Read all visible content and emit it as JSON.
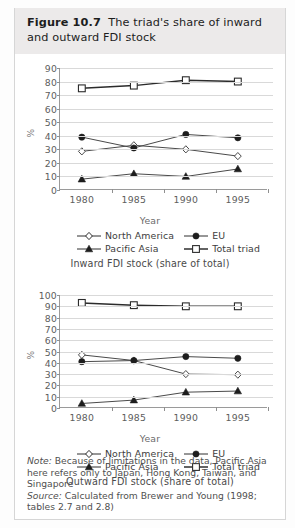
{
  "figure": {
    "label": "Figure 10.7",
    "title": "The triad's share of inward and outward FDI stock"
  },
  "footer": {
    "note_label": "Note:",
    "note_text": " Because of limitations in the data, Pacific Asia here refers only to Japan, Hong Kong, Taiwan, and Singapore",
    "source_label": "Source:",
    "source_text": " Calculated from Brewer and Young (1998; tables 2.7 and 2.8)"
  },
  "legend": {
    "north_america": "North America",
    "eu": "EU",
    "pacific_asia": "Pacific Asia",
    "total_triad": "Total triad"
  },
  "axis": {
    "ylabel": "%",
    "xlabel": "Year"
  },
  "charts": [
    {
      "caption": "Inward FDI stock (share of total)",
      "yticks": [
        "90",
        "80",
        "70",
        "60",
        "50",
        "40",
        "30",
        "20",
        "10",
        "0"
      ],
      "xticks": [
        "1980",
        "1985",
        "1990",
        "1995"
      ]
    },
    {
      "caption": "Outward FDI stock (share of total)",
      "yticks": [
        "100",
        "90",
        "80",
        "70",
        "60",
        "50",
        "40",
        "30",
        "20",
        "10",
        "0"
      ],
      "xticks": [
        "1980",
        "1985",
        "1990",
        "1995"
      ]
    }
  ],
  "chart_data": [
    {
      "type": "line",
      "title": "Inward FDI stock (share of total)",
      "xlabel": "Year",
      "ylabel": "%",
      "categories": [
        1980,
        1985,
        1990,
        1995
      ],
      "ylim": [
        0,
        90
      ],
      "ytick_step": 10,
      "grid": true,
      "legend_position": "bottom",
      "series": [
        {
          "name": "North America",
          "marker": "open-diamond",
          "values": [
            28.5,
            33,
            30,
            25
          ]
        },
        {
          "name": "EU",
          "marker": "filled-circle",
          "values": [
            39,
            31,
            41,
            38.5
          ]
        },
        {
          "name": "Pacific Asia",
          "marker": "filled-triangle",
          "values": [
            8,
            12,
            10,
            15.5
          ]
        },
        {
          "name": "Total triad",
          "marker": "open-square",
          "values": [
            75,
            77,
            81,
            80
          ]
        }
      ]
    },
    {
      "type": "line",
      "title": "Outward FDI stock (share of total)",
      "xlabel": "Year",
      "ylabel": "%",
      "categories": [
        1980,
        1985,
        1990,
        1995
      ],
      "ylim": [
        0,
        100
      ],
      "ytick_step": 10,
      "grid": true,
      "legend_position": "bottom",
      "series": [
        {
          "name": "North America",
          "marker": "open-diamond",
          "values": [
            47,
            42,
            30,
            29.5
          ]
        },
        {
          "name": "EU",
          "marker": "filled-circle",
          "values": [
            41,
            42,
            45.5,
            44
          ]
        },
        {
          "name": "Pacific Asia",
          "marker": "filled-triangle",
          "values": [
            4,
            7,
            14,
            15
          ]
        },
        {
          "name": "Total triad",
          "marker": "open-square",
          "values": [
            93,
            91,
            90,
            90
          ]
        }
      ]
    }
  ],
  "colors": {
    "line": "#4a4a4a",
    "line_bold": "#2b2b2b",
    "grid": "#d9d9d9",
    "axis": "#9a9a9a",
    "header_band": "#eceaea"
  }
}
